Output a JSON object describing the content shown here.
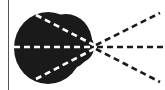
{
  "diagram": {
    "colors": {
      "background": "#ffffff",
      "blob": "#1a1a1a",
      "inner_dash": "#ffffff",
      "outer_dash": "#1a1a1a",
      "border_line": "#555555"
    },
    "focal_point": {
      "x": 94,
      "y": 47
    },
    "inner_rays": [
      {
        "name": "upper",
        "x1": 36,
        "y1": 15,
        "x2": 94,
        "y2": 45
      },
      {
        "name": "middle",
        "x1": 14,
        "y1": 47,
        "x2": 94,
        "y2": 47
      },
      {
        "name": "lower",
        "x1": 36,
        "y1": 79,
        "x2": 94,
        "y2": 49
      }
    ],
    "outer_rays": [
      {
        "name": "upper",
        "x1": 96,
        "y1": 45,
        "x2": 160,
        "y2": 13
      },
      {
        "name": "middle",
        "x1": 97,
        "y1": 47,
        "x2": 164,
        "y2": 47
      },
      {
        "name": "lower",
        "x1": 96,
        "y1": 49,
        "x2": 160,
        "y2": 82
      }
    ]
  }
}
